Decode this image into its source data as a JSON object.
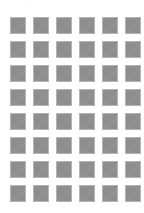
{
  "grid": {
    "columns": 6,
    "rows": 8,
    "tile_count": 48,
    "tile_color": "#8f8f8f",
    "tile_border_color": "#b4b4b4",
    "background_color": "#ffffff"
  }
}
